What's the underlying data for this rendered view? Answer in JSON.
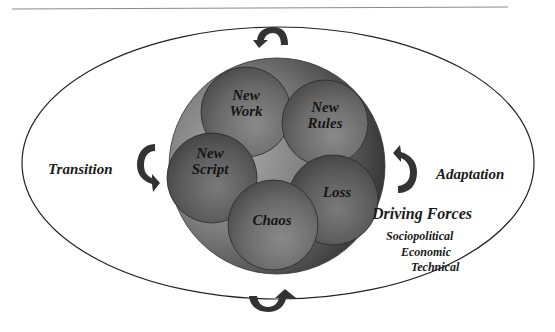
{
  "diagram": {
    "center_circle_labels": {
      "new_work": "New\nWork",
      "new_rules": "New\nRules",
      "new_script": "New\nScript",
      "loss": "Loss",
      "chaos": "Chaos"
    },
    "side_labels": {
      "transition": "Transition",
      "adaptation": "Adaptation"
    },
    "driving_forces": {
      "title": "Driving Forces",
      "items": [
        "Sociopolitical",
        "Economic",
        "Technical"
      ]
    },
    "arrows": [
      {
        "position": "top",
        "icon": "curved-arrow-counterclockwise"
      },
      {
        "position": "left",
        "icon": "curved-arrow-down"
      },
      {
        "position": "right",
        "icon": "curved-arrow-up"
      },
      {
        "position": "bottom",
        "icon": "curved-arrow-up-right"
      }
    ],
    "colors": {
      "outline": "#222222",
      "big_circle_dark": "#3a3a3a",
      "big_circle_light": "#9a9a9a",
      "inner_circle": "#6e6e6e",
      "arrow": "#333333"
    }
  }
}
